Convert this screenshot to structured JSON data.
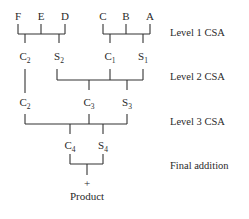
{
  "diagram": {
    "inputs": [
      "F",
      "E",
      "D",
      "C",
      "B",
      "A"
    ],
    "levels": [
      {
        "label": "Level 1 CSA",
        "outputs": [
          {
            "base": "C",
            "sub": "2"
          },
          {
            "base": "S",
            "sub": "2"
          },
          {
            "base": "C",
            "sub": "1"
          },
          {
            "base": "S",
            "sub": "1"
          }
        ]
      },
      {
        "label": "Level 2 CSA",
        "outputs": [
          {
            "base": "C",
            "sub": "2"
          },
          {
            "base": "C",
            "sub": "3"
          },
          {
            "base": "S",
            "sub": "3"
          }
        ]
      },
      {
        "label": "Level 3 CSA",
        "outputs": [
          {
            "base": "C",
            "sub": "4"
          },
          {
            "base": "S",
            "sub": "4"
          }
        ]
      },
      {
        "label": "Final addition",
        "outputs": []
      }
    ],
    "plus": "+",
    "result": "Product",
    "colors": {
      "line": "#333333",
      "text": "#2a2a2a",
      "background": "#ffffff"
    }
  }
}
